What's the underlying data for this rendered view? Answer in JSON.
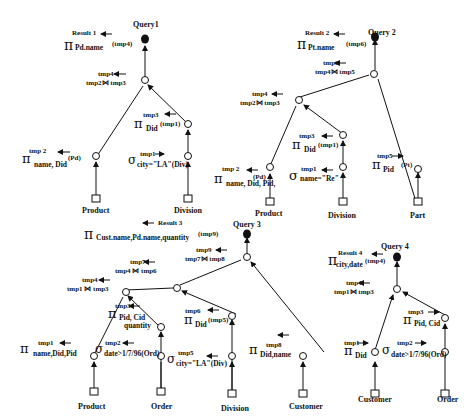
{
  "queries": [
    {
      "title": "Query1",
      "result": "Result 1",
      "nodes": {
        "root": {
          "op": "π",
          "sub": "Pd.name",
          "arg": "(tmp4)"
        },
        "join": {
          "out": "tmp4",
          "expr": "tmp2⋈ tmp3"
        },
        "proj_did": {
          "out": "tmp3",
          "op": "π",
          "sub": "Did",
          "arg": "(tmp1)"
        },
        "proj_name": {
          "out": "tmp 2",
          "op": "π",
          "sub": "name, Did",
          "arg": "(Pd)"
        },
        "select": {
          "out": "tmp1",
          "op": "σ",
          "sub": "city=\"LA\"(Div)"
        }
      },
      "relations": [
        "Product",
        "Division"
      ]
    },
    {
      "title": "Query 2",
      "result": "Result 2",
      "nodes": {
        "root": {
          "op": "π",
          "sub": "Pt.name",
          "arg": "(tmp6)"
        },
        "join_top": {
          "out": "tmp6",
          "expr": "tmp4⋈ tmp5"
        },
        "join": {
          "out": "tmp4",
          "expr": "tmp2⋈ tmp3"
        },
        "proj_did": {
          "out": "tmp3",
          "op": "π",
          "sub": "Did",
          "arg": "(tmp1)"
        },
        "proj_name": {
          "out": "tmp 2",
          "op": "π",
          "sub": "name, Did, Pid,",
          "arg": "(Pd)"
        },
        "select": {
          "out": "tmp1",
          "op": "σ",
          "sub": "name=\"Re\""
        },
        "proj_pid": {
          "out": "tmp5",
          "op": "π",
          "sub": "Pid",
          "arg": "(Pt)"
        }
      },
      "relations": [
        "Product",
        "Division",
        "Part"
      ]
    },
    {
      "title": "Query 3",
      "result": "Result 3",
      "nodes": {
        "root": {
          "op": "π",
          "sub": "Cust.name,Pd.name,quantity",
          "arg": "(tmp9)"
        },
        "join_top": {
          "out": "tmp9",
          "expr": "tmp7⋈ tmp8"
        },
        "join_mid": {
          "out": "tmp7",
          "expr": "tmp4 ⋈ tmp6"
        },
        "join_low": {
          "out": "tmp4",
          "expr": "tmp1 ⋈ tmp3"
        },
        "proj_pid_cid": {
          "out": "tmp3",
          "op": "π",
          "sub": "Pid, Cid",
          "sub2": "quantity"
        },
        "proj_did": {
          "out": "tmp6",
          "op": "π",
          "sub": "Did",
          "arg": "(tmp5)"
        },
        "proj_name": {
          "out": "tmp1",
          "op": "π",
          "sub": "name,Did,Pid"
        },
        "select_date": {
          "out": "tmp2",
          "op": "σ",
          "sub": "date>1/7/96(Ord)"
        },
        "select_city": {
          "out": "tmp5",
          "op": "σ",
          "sub": "city=\"LA\"(Div)"
        },
        "proj_cust": {
          "out": "tmp8",
          "op": "π",
          "sub": "Did,name"
        }
      },
      "relations": [
        "Product",
        "Order",
        "Division",
        "Customer"
      ]
    },
    {
      "title": "Query 4",
      "result": "Result 4",
      "nodes": {
        "root": {
          "op": "π",
          "sub": "city,date",
          "arg": "(tmp4)"
        },
        "join": {
          "out": "tmp4",
          "expr": "tmp1⋈ tmp3"
        },
        "proj_pid_cid": {
          "out": "tmp3",
          "op": "π",
          "sub": "Pid, Cid"
        },
        "proj_did": {
          "out": "tmp1",
          "op": "π",
          "sub": "Did"
        },
        "select_date": {
          "out": "tmp2",
          "op": "σ",
          "sub": "date>1/7/96(Ord)"
        }
      },
      "relations": [
        "Customer",
        "Order"
      ]
    }
  ],
  "arrow": "←"
}
